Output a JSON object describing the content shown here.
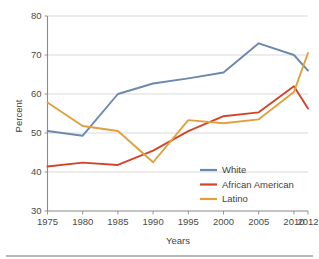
{
  "chart_data": {
    "type": "line",
    "title": "",
    "xlabel": "Years",
    "ylabel": "Percent",
    "categories": [
      "1975",
      "1980",
      "1985",
      "1990",
      "1995",
      "2000",
      "2005",
      "2010",
      "2012"
    ],
    "x": [
      1975,
      1980,
      1985,
      1990,
      1995,
      2000,
      2005,
      2010,
      2012
    ],
    "xlim": [
      1975,
      2012
    ],
    "ylim": [
      30,
      80
    ],
    "ytick_labels": [
      "30",
      "40",
      "50",
      "60",
      "70",
      "80"
    ],
    "yticks": [
      30,
      40,
      50,
      60,
      70,
      80
    ],
    "grid": true,
    "grid_axis": "y",
    "legend_position": "inside-bottom-right",
    "series": [
      {
        "name": "White",
        "color": "#6b89ab",
        "values": [
          50.5,
          49.3,
          60.0,
          62.7,
          64.0,
          65.5,
          73.0,
          70.0,
          66.0
        ]
      },
      {
        "name": "African American",
        "color": "#d2452a",
        "values": [
          41.4,
          42.4,
          41.8,
          45.5,
          50.5,
          54.3,
          55.3,
          62.0,
          56.3
        ]
      },
      {
        "name": "Latino",
        "color": "#e0a03c",
        "values": [
          57.8,
          51.8,
          50.5,
          42.5,
          53.3,
          52.5,
          53.5,
          60.5,
          70.5
        ]
      }
    ]
  },
  "axes": {
    "y_title": "Percent",
    "x_title": "Years"
  },
  "legend": {
    "entries": [
      {
        "label": "White",
        "color": "#6b89ab"
      },
      {
        "label": "African American",
        "color": "#d2452a"
      },
      {
        "label": "Latino",
        "color": "#e0a03c"
      }
    ]
  },
  "colors": {
    "white_series": "#6b89ab",
    "african_american_series": "#d2452a",
    "latino_series": "#e0a03c",
    "gridline": "#c8c8c8",
    "axis": "#8a8a8a",
    "text": "#3f3f3f",
    "background": "#ffffff"
  }
}
